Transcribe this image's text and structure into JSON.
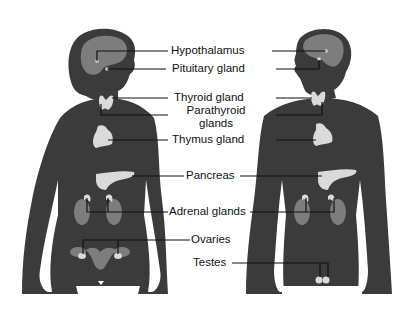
{
  "diagram": {
    "figures": [
      {
        "name": "female",
        "label": ""
      },
      {
        "name": "male",
        "label": ""
      }
    ],
    "colors": {
      "body": "#3b3b3b",
      "organ": "#7d7d7d",
      "gland": "#dadada",
      "line": "#111111",
      "background": "#ffffff"
    },
    "labels": [
      {
        "id": "hypothalamus",
        "text": "Hypothalamus"
      },
      {
        "id": "pituitary",
        "text": "Pituitary gland"
      },
      {
        "id": "thyroid",
        "text": "Thyroid gland"
      },
      {
        "id": "parathyroid",
        "text": "Parathyroid glands"
      },
      {
        "id": "thymus",
        "text": "Thymus gland"
      },
      {
        "id": "pancreas",
        "text": "Pancreas"
      },
      {
        "id": "adrenal",
        "text": "Adrenal glands"
      },
      {
        "id": "ovaries",
        "text": "Ovaries"
      },
      {
        "id": "testes",
        "text": "Testes"
      }
    ]
  }
}
